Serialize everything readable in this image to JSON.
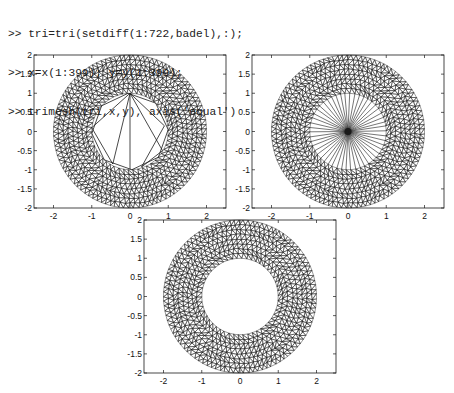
{
  "console": {
    "prompt": ">>",
    "lines": [
      "tri=tri(setdiff(1:722,badel),:);",
      "x=x(1:399); y=y(1:399);",
      "trimesh(tri,x,y), axis('equal')"
    ]
  },
  "chart_data": [
    {
      "type": "mesh",
      "title": "",
      "description": "Annulus triangulation (outer radius 2, inner radius 1) with spurious triangles spanning the hole (octagon with diagonals)",
      "hole": "polygon-with-diagonals",
      "xlabel": "",
      "ylabel": "",
      "xlim": [
        -2.5,
        2.5
      ],
      "ylim": [
        -2,
        2
      ],
      "xticks": [
        "-2",
        "-1",
        "0",
        "1",
        "2"
      ],
      "yticks": [
        "2",
        "1.5",
        "1",
        "0.5",
        "0",
        "-0.5",
        "-1",
        "-1.5",
        "-2"
      ],
      "outer_radius": 2,
      "inner_radius": 1
    },
    {
      "type": "mesh",
      "title": "",
      "description": "Annulus triangulation with hole filled by fan of triangles to a central point",
      "hole": "fan",
      "xlabel": "",
      "ylabel": "",
      "xlim": [
        -2.5,
        2.5
      ],
      "ylim": [
        -2,
        2
      ],
      "xticks": [
        "-2",
        "-1",
        "0",
        "1",
        "2"
      ],
      "yticks": [
        "2",
        "1.5",
        "1",
        "0.5",
        "0",
        "-0.5",
        "-1",
        "-1.5",
        "-2"
      ],
      "outer_radius": 2,
      "inner_radius": 1
    },
    {
      "type": "mesh",
      "title": "",
      "description": "Cleaned annulus triangulation, hole empty",
      "hole": "empty",
      "xlabel": "",
      "ylabel": "",
      "xlim": [
        -2.5,
        2.5
      ],
      "ylim": [
        -2,
        2
      ],
      "xticks": [
        "-2",
        "-1",
        "0",
        "1",
        "2"
      ],
      "yticks": [
        "2",
        "1.5",
        "1",
        "0.5",
        "0",
        "-0.5",
        "-1",
        "-1.5",
        "-2"
      ],
      "outer_radius": 2,
      "inner_radius": 1
    }
  ],
  "colors": {
    "line": "#1a1a1a",
    "background": "#ffffff"
  }
}
